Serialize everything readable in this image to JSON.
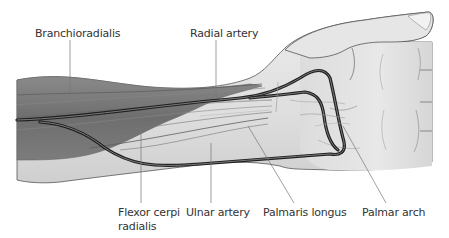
{
  "diagram": {
    "labels": {
      "brachioradialis": "Branchioradialis",
      "radial_artery": "Radial artery",
      "flexor_line1": "Flexor cerpi",
      "flexor_line2": "radialis",
      "ulnar_artery": "Ulnar artery",
      "palmaris_longus": "Palmaris longus",
      "palmar_arch": "Palmar arch"
    },
    "colors": {
      "skin": "#e4e4e4",
      "skin_shadow": "#cfcfcf",
      "muscle": "#7a7a7a",
      "muscle_dark": "#5e5e5e",
      "artery": "#2e2e2e",
      "leader_line": "#777777",
      "text": "#333333"
    }
  }
}
